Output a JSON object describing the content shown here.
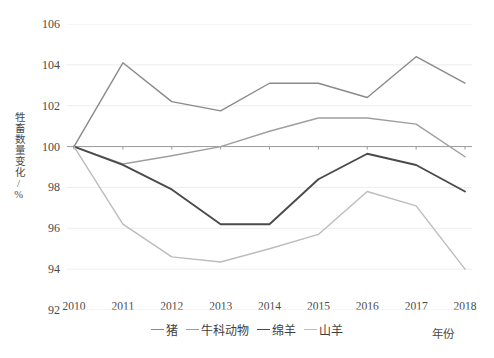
{
  "chart_data": {
    "type": "line",
    "title": "",
    "xlabel": "年份",
    "ylabel": "牲畜数量变化/%",
    "x": [
      2010,
      2011,
      2012,
      2013,
      2014,
      2015,
      2016,
      2017,
      2018
    ],
    "xticklabels": [
      "2010",
      "2011",
      "2012",
      "2013",
      "2014",
      "2015",
      "2016",
      "2017",
      "2018"
    ],
    "yticklabels": [
      "92",
      "94",
      "96",
      "98",
      "100",
      "102",
      "104",
      "106"
    ],
    "ylim": [
      92,
      106
    ],
    "ytick_step": 2,
    "xlim": [
      2010,
      2018
    ],
    "grid": "horizontal",
    "legend_position": "bottom",
    "series": [
      {
        "name": "猪",
        "color": "#8a8a8a",
        "values": [
          100.0,
          104.1,
          102.2,
          101.75,
          103.1,
          103.1,
          102.4,
          104.4,
          103.1
        ]
      },
      {
        "name": "牛科动物",
        "color": "#9e9e9e",
        "values": [
          100.0,
          99.15,
          99.55,
          100.0,
          100.75,
          101.4,
          101.4,
          101.1,
          99.5
        ]
      },
      {
        "name": "绵羊",
        "color": "#4a4a4a",
        "values": [
          100.0,
          99.1,
          97.9,
          96.2,
          96.2,
          98.4,
          99.65,
          99.1,
          97.8
        ]
      },
      {
        "name": "山羊",
        "color": "#bcbcbc",
        "values": [
          100.0,
          96.2,
          94.6,
          94.35,
          95.0,
          95.7,
          97.8,
          97.1,
          94.0
        ]
      }
    ]
  },
  "axis": {
    "baseline_value": "100"
  }
}
